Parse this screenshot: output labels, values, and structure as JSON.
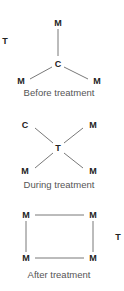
{
  "colors": {
    "line": "#555555",
    "label": "#222222",
    "caption": "#555555"
  },
  "panels": [
    {
      "caption": "Before treatment",
      "caption_pos": [
        59,
        93
      ],
      "nodes": [
        {
          "label": "M",
          "pos": [
            58,
            23
          ]
        },
        {
          "label": "C",
          "pos": [
            58,
            64
          ]
        },
        {
          "label": "M",
          "pos": [
            21,
            81
          ]
        },
        {
          "label": "M",
          "pos": [
            97,
            81
          ]
        },
        {
          "label": "T",
          "pos": [
            5,
            41
          ]
        }
      ],
      "edges": [
        [
          58,
          29,
          58,
          56
        ],
        [
          30,
          79,
          52,
          67
        ],
        [
          64,
          67,
          88,
          79
        ]
      ]
    },
    {
      "caption": "During treatment",
      "caption_pos": [
        59,
        185
      ],
      "nodes": [
        {
          "label": "C",
          "pos": [
            25,
            125
          ]
        },
        {
          "label": "M",
          "pos": [
            93,
            125
          ]
        },
        {
          "label": "T",
          "pos": [
            58,
            148
          ]
        },
        {
          "label": "M",
          "pos": [
            25,
            171
          ]
        },
        {
          "label": "M",
          "pos": [
            93,
            171
          ]
        }
      ],
      "edges": [
        [
          35,
          128,
          53,
          143
        ],
        [
          83,
          128,
          64,
          143
        ],
        [
          53,
          153,
          35,
          168
        ],
        [
          64,
          153,
          83,
          168
        ]
      ]
    },
    {
      "caption": "After treatment",
      "caption_pos": [
        59,
        275
      ],
      "nodes": [
        {
          "label": "M",
          "pos": [
            26,
            215
          ]
        },
        {
          "label": "M",
          "pos": [
            93,
            215
          ]
        },
        {
          "label": "M",
          "pos": [
            26,
            258
          ]
        },
        {
          "label": "M",
          "pos": [
            93,
            258
          ]
        },
        {
          "label": "T",
          "pos": [
            118,
            237
          ]
        }
      ],
      "edges": [
        [
          35,
          215,
          84,
          215
        ],
        [
          35,
          258,
          84,
          258
        ],
        [
          26,
          221,
          26,
          252
        ],
        [
          93,
          221,
          93,
          252
        ]
      ]
    }
  ]
}
